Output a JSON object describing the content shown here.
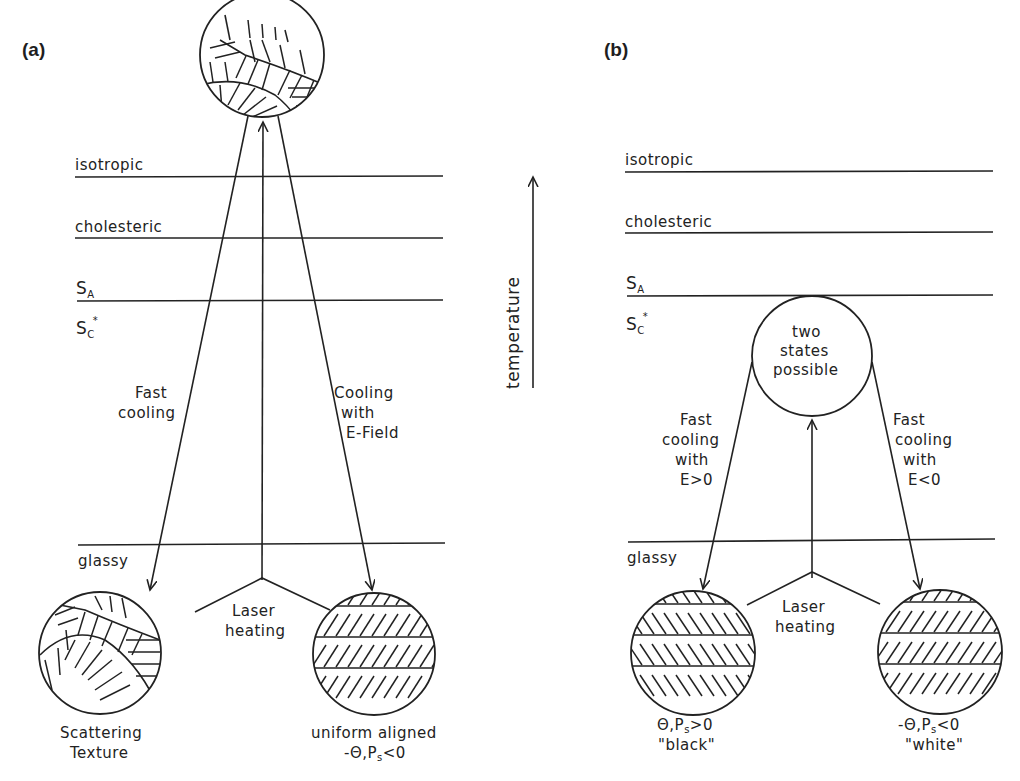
{
  "figure": {
    "panel_a": {
      "label": "(a)",
      "phases": [
        "isotropic",
        "cholesteric",
        "S",
        "S",
        "glassy"
      ],
      "phase_subscripts": {
        "sa": "A",
        "sc": "C",
        "sc_star": "*"
      },
      "arrows": {
        "left": [
          "Fast",
          "cooling"
        ],
        "right": [
          "Cooling",
          "with",
          "E-Field"
        ],
        "center": [
          "Laser",
          "heating"
        ]
      },
      "states": {
        "left": [
          "Scattering",
          "Texture"
        ],
        "right_line1": "uniform aligned",
        "right_line2_prefix": "-Θ,P",
        "right_line2_sub": "s",
        "right_line2_suffix": "<0"
      }
    },
    "temperature_axis": {
      "label": "temperature"
    },
    "panel_b": {
      "label": "(b)",
      "phases": [
        "isotropic",
        "cholesteric",
        "S",
        "S",
        "glassy"
      ],
      "phase_subscripts": {
        "sa": "A",
        "sc": "C",
        "sc_star": "*"
      },
      "top_state": [
        "two",
        "states",
        "possible"
      ],
      "arrows": {
        "left": [
          "Fast",
          "cooling",
          "with",
          "E>0"
        ],
        "right": [
          "Fast",
          "cooling",
          "with",
          "E<0"
        ],
        "center": [
          "Laser",
          "heating"
        ]
      },
      "states": {
        "left_line1_prefix": "Θ,P",
        "left_line1_sub": "s",
        "left_line1_suffix": ">0",
        "left_line2": "\"black\"",
        "right_line1_prefix": "-Θ,P",
        "right_line1_sub": "s",
        "right_line1_suffix": "<0",
        "right_line2": "\"white\""
      }
    }
  }
}
